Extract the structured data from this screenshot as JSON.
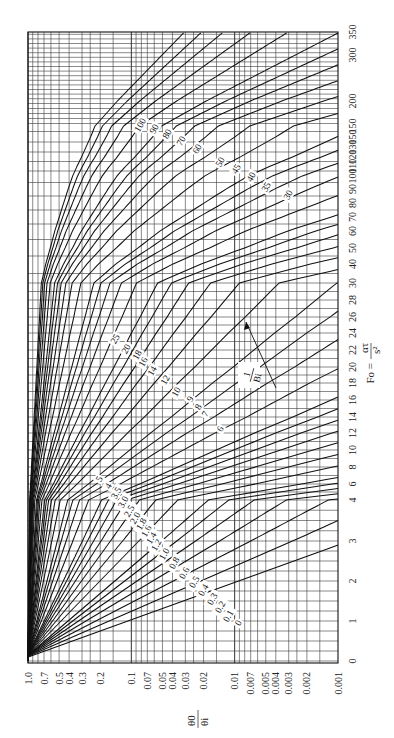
{
  "chart_data": {
    "type": "line",
    "title": "",
    "orientation": "rotated-90-clockwise",
    "xlabel": "Fo = ατ / s²",
    "ylabel": "θ0 / θi",
    "x_axis": {
      "name": "Fo",
      "scale": "piecewise-linear",
      "range": [
        0,
        350
      ],
      "ticks": [
        {
          "value": 0,
          "label": "0",
          "pos": 661
        },
        {
          "value": 1,
          "label": "1",
          "pos": 621
        },
        {
          "value": 2,
          "label": "2",
          "pos": 581
        },
        {
          "value": 3,
          "label": "3",
          "pos": 541
        },
        {
          "value": 4,
          "label": "4",
          "pos": 500
        },
        {
          "value": 6,
          "label": "6",
          "pos": 484
        },
        {
          "value": 8,
          "label": "8",
          "pos": 467
        },
        {
          "value": 10,
          "label": "10",
          "pos": 450
        },
        {
          "value": 12,
          "label": "12",
          "pos": 433
        },
        {
          "value": 14,
          "label": "14",
          "pos": 417
        },
        {
          "value": 16,
          "label": "16",
          "pos": 400
        },
        {
          "value": 18,
          "label": "18",
          "pos": 383
        },
        {
          "value": 20,
          "label": "20",
          "pos": 367
        },
        {
          "value": 22,
          "label": "22",
          "pos": 350
        },
        {
          "value": 24,
          "label": "24",
          "pos": 333
        },
        {
          "value": 26,
          "label": "26",
          "pos": 317
        },
        {
          "value": 28,
          "label": "28",
          "pos": 300
        },
        {
          "value": 30,
          "label": "30",
          "pos": 283
        },
        {
          "value": 40,
          "label": "40",
          "pos": 264
        },
        {
          "value": 50,
          "label": "50",
          "pos": 248
        },
        {
          "value": 60,
          "label": "60",
          "pos": 231
        },
        {
          "value": 70,
          "label": "70",
          "pos": 217
        },
        {
          "value": 80,
          "label": "80",
          "pos": 203
        },
        {
          "value": 90,
          "label": "90",
          "pos": 189
        },
        {
          "value": 100,
          "label": "100",
          "pos": 176
        },
        {
          "value": 110,
          "label": "110",
          "pos": 166
        },
        {
          "value": 120,
          "label": "120",
          "pos": 157
        },
        {
          "value": 130,
          "label": "130",
          "pos": 147
        },
        {
          "value": 140,
          "label": "150",
          "pos": 137
        },
        {
          "value": 150,
          "label": "150",
          "pos": 126
        },
        {
          "value": 200,
          "label": "200",
          "pos": 101
        },
        {
          "value": 300,
          "label": "300",
          "pos": 55
        },
        {
          "value": 350,
          "label": "350",
          "pos": 32
        }
      ]
    },
    "y_axis": {
      "name": "θ0/θi",
      "scale": "log",
      "range": [
        0.001,
        1.0
      ],
      "ticks": [
        {
          "value": 1.0,
          "label": "1.0"
        },
        {
          "value": 0.7,
          "label": "0.7"
        },
        {
          "value": 0.5,
          "label": "0.5"
        },
        {
          "value": 0.4,
          "label": "0.4"
        },
        {
          "value": 0.3,
          "label": "0.3"
        },
        {
          "value": 0.2,
          "label": "0.2"
        },
        {
          "value": 0.1,
          "label": "0.1"
        },
        {
          "value": 0.07,
          "label": "0.07"
        },
        {
          "value": 0.05,
          "label": "0.05"
        },
        {
          "value": 0.04,
          "label": "0.04"
        },
        {
          "value": 0.03,
          "label": "0.03"
        },
        {
          "value": 0.02,
          "label": "0.02"
        },
        {
          "value": 0.01,
          "label": "0.01"
        },
        {
          "value": 0.007,
          "label": "0.007"
        },
        {
          "value": 0.005,
          "label": "0.005"
        },
        {
          "value": 0.004,
          "label": "0.004"
        },
        {
          "value": 0.003,
          "label": "0.003"
        },
        {
          "value": 0.002,
          "label": "0.002"
        },
        {
          "value": 0.001,
          "label": "0.001"
        }
      ]
    },
    "series_parameter": "1/Bi",
    "series": [
      {
        "name": "0",
        "inv_bi": 0,
        "label_pos": [
          240,
          624
        ]
      },
      {
        "name": "0.1",
        "inv_bi": 0.1,
        "label_pos": [
          230,
          617
        ]
      },
      {
        "name": "0.2",
        "inv_bi": 0.2,
        "label_pos": [
          222,
          608
        ]
      },
      {
        "name": "0.3",
        "inv_bi": 0.3,
        "label_pos": [
          214,
          600
        ]
      },
      {
        "name": "0.4",
        "inv_bi": 0.4,
        "label_pos": [
          205,
          591
        ]
      },
      {
        "name": "0.5",
        "inv_bi": 0.5,
        "label_pos": [
          196,
          583
        ]
      },
      {
        "name": "0.6",
        "inv_bi": 0.6,
        "label_pos": [
          186,
          574
        ]
      },
      {
        "name": "0.8",
        "inv_bi": 0.8,
        "label_pos": [
          176,
          564
        ]
      },
      {
        "name": "1.0",
        "inv_bi": 1.0,
        "label_pos": [
          166,
          555
        ]
      },
      {
        "name": "1.2",
        "inv_bi": 1.2,
        "label_pos": [
          158,
          546
        ]
      },
      {
        "name": "1.4",
        "inv_bi": 1.4,
        "label_pos": [
          153,
          539
        ]
      },
      {
        "name": "1.6",
        "inv_bi": 1.6,
        "label_pos": [
          148,
          532
        ]
      },
      {
        "name": "1.8",
        "inv_bi": 1.8,
        "label_pos": [
          143,
          525
        ]
      },
      {
        "name": "2.0",
        "inv_bi": 2.0,
        "label_pos": [
          137,
          519
        ]
      },
      {
        "name": "2.5",
        "inv_bi": 2.5,
        "label_pos": [
          131,
          512
        ]
      },
      {
        "name": "3.0",
        "inv_bi": 3.0,
        "label_pos": [
          125,
          503
        ]
      },
      {
        "name": "3.5",
        "inv_bi": 3.5,
        "label_pos": [
          118,
          494
        ]
      },
      {
        "name": "4",
        "inv_bi": 4,
        "label_pos": [
          110,
          487
        ]
      },
      {
        "name": "5",
        "inv_bi": 5,
        "label_pos": [
          101,
          480
        ]
      },
      {
        "name": "6",
        "inv_bi": 6,
        "label_pos": [
          222,
          430
        ]
      },
      {
        "name": "7",
        "inv_bi": 7,
        "label_pos": [
          207,
          415
        ]
      },
      {
        "name": "8",
        "inv_bi": 8,
        "label_pos": [
          200,
          408
        ]
      },
      {
        "name": "9",
        "inv_bi": 9,
        "label_pos": [
          192,
          400
        ]
      },
      {
        "name": "10",
        "inv_bi": 10,
        "label_pos": [
          178,
          393
        ]
      },
      {
        "name": "12",
        "inv_bi": 12,
        "label_pos": [
          167,
          381
        ]
      },
      {
        "name": "14",
        "inv_bi": 14,
        "label_pos": [
          154,
          372
        ]
      },
      {
        "name": "16",
        "inv_bi": 16,
        "label_pos": [
          145,
          363
        ]
      },
      {
        "name": "18",
        "inv_bi": 18,
        "label_pos": [
          139,
          356
        ]
      },
      {
        "name": "20",
        "inv_bi": 20,
        "label_pos": [
          128,
          350
        ]
      },
      {
        "name": "25",
        "inv_bi": 25,
        "label_pos": [
          117,
          340
        ]
      },
      {
        "name": "30",
        "inv_bi": 30,
        "label_pos": [
          290,
          196
        ]
      },
      {
        "name": "35",
        "inv_bi": 35,
        "label_pos": [
          268,
          188
        ]
      },
      {
        "name": "40",
        "inv_bi": 40,
        "label_pos": [
          253,
          178
        ]
      },
      {
        "name": "45",
        "inv_bi": 45,
        "label_pos": [
          238,
          170
        ]
      },
      {
        "name": "50",
        "inv_bi": 50,
        "label_pos": [
          222,
          163
        ]
      },
      {
        "name": "60",
        "inv_bi": 60,
        "label_pos": [
          199,
          150
        ]
      },
      {
        "name": "70",
        "inv_bi": 70,
        "label_pos": [
          183,
          142
        ]
      },
      {
        "name": "80",
        "inv_bi": 80,
        "label_pos": [
          169,
          135
        ]
      },
      {
        "name": "90",
        "inv_bi": 90,
        "label_pos": [
          156,
          130
        ]
      },
      {
        "name": "100",
        "inv_bi": 100,
        "label_pos": [
          142,
          126
        ]
      }
    ],
    "annotations": [
      {
        "text": "1/Bi",
        "arrow": true,
        "label_pos": [
          259,
          375
        ]
      }
    ],
    "grid": true,
    "legend": "inline curve labels"
  },
  "labels": {
    "x_title_lhs": "Fo =",
    "x_title_num": "ατ",
    "x_title_den": "s²",
    "y_title_num": "θ0",
    "y_title_den": "θi",
    "bi_num": "1",
    "bi_den": "Bi"
  },
  "layout": {
    "plot_left": 28,
    "plot_right": 338,
    "plot_top": 32,
    "plot_bottom": 663
  }
}
